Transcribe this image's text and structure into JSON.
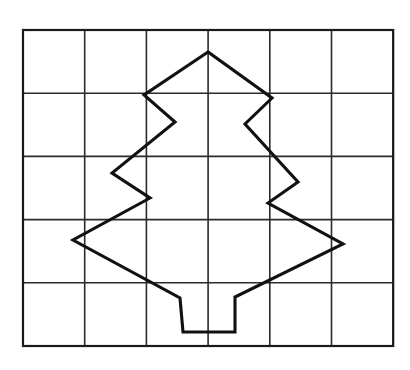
{
  "figure": {
    "background_color": "#ffffff",
    "canvas": {
      "width": 410,
      "height": 370
    }
  },
  "grid": {
    "name": "square-grid",
    "columns": 6,
    "rows": 5,
    "x_start": 23,
    "y_start": 30,
    "cell_width": 61.7,
    "cell_height": 63.2,
    "line_color": "#2b2b2b",
    "border_color": "#1a1a1a",
    "line_width": 1.6,
    "border_width": 2.2,
    "x_lines": [
      23,
      84.7,
      146.4,
      208.1,
      269.8,
      331.5,
      393.2
    ],
    "y_lines": [
      30,
      93.2,
      156.4,
      219.6,
      282.8,
      346
    ]
  },
  "shape": {
    "name": "christmas-tree",
    "stroke_color": "#111111",
    "stroke_width": 3.1,
    "fill": "none",
    "closed": true,
    "description": "Symmetric three-tier zig-zag conifer silhouette with rectangular trunk",
    "apex": {
      "x": 208,
      "y": 52
    },
    "points": [
      [
        208,
        52
      ],
      [
        144,
        95
      ],
      [
        175,
        122
      ],
      [
        112,
        173
      ],
      [
        150,
        198
      ],
      [
        73,
        240
      ],
      [
        180,
        298
      ],
      [
        183,
        332
      ],
      [
        235,
        332
      ],
      [
        235,
        297
      ],
      [
        343,
        244
      ],
      [
        268,
        203
      ],
      [
        298,
        182
      ],
      [
        245,
        124
      ],
      [
        272,
        98
      ]
    ]
  }
}
